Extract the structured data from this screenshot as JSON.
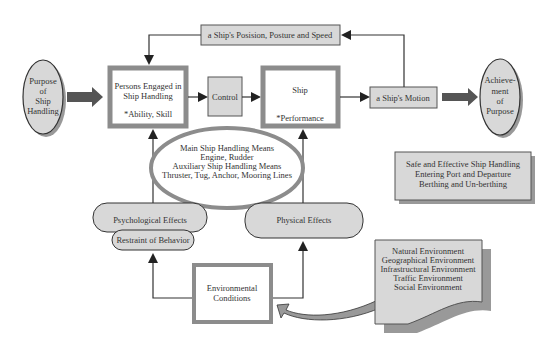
{
  "diagram": {
    "title": "",
    "nodes": {
      "purpose": {
        "lines": [
          "Purpose",
          "of",
          "Ship",
          "Handling"
        ]
      },
      "persons": {
        "lines": [
          "Persons Engaged in",
          "Ship Handling"
        ],
        "note": "*Ability, Skill"
      },
      "control": {
        "label": "Control"
      },
      "ship": {
        "label": "Ship",
        "note": "*Performance"
      },
      "motion": {
        "label": "a Ship's Motion"
      },
      "achievement": {
        "lines": [
          "Achieve-",
          "ment",
          "of",
          "Purpose"
        ]
      },
      "feedback": {
        "label": "a Ship's Posision, Posture and Speed"
      },
      "means": {
        "lines": [
          "Main Ship Handling Means",
          "Engine, Rudder",
          "Auxiliary Ship Handling Means",
          "Thruster, Tug, Anchor, Mooring Lines"
        ]
      },
      "goals": {
        "lines": [
          "Safe and Effective Ship Handling",
          "Entering Port and Departure",
          "Berthing and Un-berthing"
        ]
      },
      "psych": {
        "label": "Psychological Effects"
      },
      "restraint": {
        "label": "Restraint of Behavior"
      },
      "physical": {
        "label": "Physical Effects"
      },
      "env_conditions": {
        "lines": [
          "Environmental",
          "Conditions"
        ]
      },
      "environments": {
        "lines": [
          "Natural Environment",
          "Geographical Environment",
          "Infrastructural Environment",
          "Traffic Environment",
          "Social Environment"
        ]
      }
    },
    "colors": {
      "box_fill": "#d8d8d8",
      "border_gray": "#8c8c8c",
      "thick_arrow": "#555555",
      "line": "#333333"
    }
  }
}
